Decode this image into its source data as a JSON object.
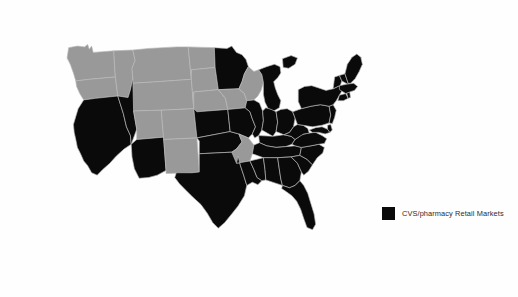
{
  "figure": {
    "type": "choropleth-map",
    "region": "United States",
    "background_color": "#fefefe"
  },
  "legend": {
    "position": "right-middle",
    "entries": [
      {
        "swatch_color": "#0a0a0a",
        "label": "CVS/pharmacy Retail Markets"
      }
    ]
  },
  "map_colors": {
    "highlight": "#0a0a0a",
    "base": "#999999",
    "border": "#b9b9b9"
  },
  "states": [
    {
      "code": "WA",
      "name": "Washington",
      "highlighted": false
    },
    {
      "code": "OR",
      "name": "Oregon",
      "highlighted": false
    },
    {
      "code": "CA",
      "name": "California",
      "highlighted": true
    },
    {
      "code": "NV",
      "name": "Nevada",
      "highlighted": true
    },
    {
      "code": "ID",
      "name": "Idaho",
      "highlighted": false
    },
    {
      "code": "MT",
      "name": "Montana",
      "highlighted": false
    },
    {
      "code": "WY",
      "name": "Wyoming",
      "highlighted": false
    },
    {
      "code": "UT",
      "name": "Utah",
      "highlighted": false
    },
    {
      "code": "AZ",
      "name": "Arizona",
      "highlighted": true
    },
    {
      "code": "CO",
      "name": "Colorado",
      "highlighted": false
    },
    {
      "code": "NM",
      "name": "New Mexico",
      "highlighted": false
    },
    {
      "code": "ND",
      "name": "North Dakota",
      "highlighted": false
    },
    {
      "code": "SD",
      "name": "South Dakota",
      "highlighted": false
    },
    {
      "code": "NE",
      "name": "Nebraska",
      "highlighted": false
    },
    {
      "code": "KS",
      "name": "Kansas",
      "highlighted": true
    },
    {
      "code": "OK",
      "name": "Oklahoma",
      "highlighted": true
    },
    {
      "code": "TX",
      "name": "Texas",
      "highlighted": true
    },
    {
      "code": "MN",
      "name": "Minnesota",
      "highlighted": true
    },
    {
      "code": "IA",
      "name": "Iowa",
      "highlighted": false
    },
    {
      "code": "MO",
      "name": "Missouri",
      "highlighted": true
    },
    {
      "code": "AR",
      "name": "Arkansas",
      "highlighted": false
    },
    {
      "code": "LA",
      "name": "Louisiana",
      "highlighted": true
    },
    {
      "code": "WI",
      "name": "Wisconsin",
      "highlighted": false
    },
    {
      "code": "IL",
      "name": "Illinois",
      "highlighted": true
    },
    {
      "code": "MI",
      "name": "Michigan",
      "highlighted": true
    },
    {
      "code": "IN",
      "name": "Indiana",
      "highlighted": true
    },
    {
      "code": "OH",
      "name": "Ohio",
      "highlighted": true
    },
    {
      "code": "KY",
      "name": "Kentucky",
      "highlighted": true
    },
    {
      "code": "TN",
      "name": "Tennessee",
      "highlighted": true
    },
    {
      "code": "MS",
      "name": "Mississippi",
      "highlighted": true
    },
    {
      "code": "AL",
      "name": "Alabama",
      "highlighted": true
    },
    {
      "code": "GA",
      "name": "Georgia",
      "highlighted": true
    },
    {
      "code": "FL",
      "name": "Florida",
      "highlighted": true
    },
    {
      "code": "SC",
      "name": "South Carolina",
      "highlighted": true
    },
    {
      "code": "NC",
      "name": "North Carolina",
      "highlighted": true
    },
    {
      "code": "VA",
      "name": "Virginia",
      "highlighted": true
    },
    {
      "code": "WV",
      "name": "West Virginia",
      "highlighted": true
    },
    {
      "code": "MD",
      "name": "Maryland",
      "highlighted": true
    },
    {
      "code": "DE",
      "name": "Delaware",
      "highlighted": true
    },
    {
      "code": "PA",
      "name": "Pennsylvania",
      "highlighted": true
    },
    {
      "code": "NJ",
      "name": "New Jersey",
      "highlighted": true
    },
    {
      "code": "NY",
      "name": "New York",
      "highlighted": true
    },
    {
      "code": "CT",
      "name": "Connecticut",
      "highlighted": true
    },
    {
      "code": "RI",
      "name": "Rhode Island",
      "highlighted": true
    },
    {
      "code": "MA",
      "name": "Massachusetts",
      "highlighted": true
    },
    {
      "code": "VT",
      "name": "Vermont",
      "highlighted": true
    },
    {
      "code": "NH",
      "name": "New Hampshire",
      "highlighted": true
    },
    {
      "code": "ME",
      "name": "Maine",
      "highlighted": true
    }
  ]
}
